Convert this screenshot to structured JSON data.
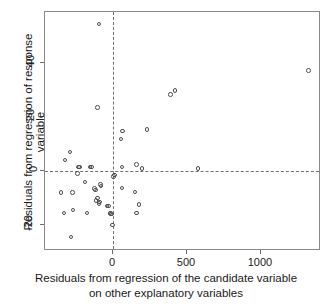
{
  "chart_data": {
    "type": "scatter",
    "title": "",
    "xlabel": "Residuals from regression of the candidate variable on other explanatory variables",
    "xlabel_line1": "Residuals from regression of the candidate variable",
    "xlabel_line2": "on other explanatory variables",
    "ylabel": "Residuals from regression of response variable",
    "xlim": [
      -430,
      1430
    ],
    "ylim": [
      -29,
      59
    ],
    "xticks": [
      0,
      500,
      1000
    ],
    "xticklabels": [
      "0",
      "500",
      "1000"
    ],
    "yticks": [
      -20,
      0,
      20,
      40
    ],
    "yticklabels": [
      "-20",
      "0",
      "20",
      "40"
    ],
    "grid": false,
    "reference_lines": [
      {
        "orientation": "horizontal",
        "value": 0,
        "style": "dashed"
      },
      {
        "orientation": "vertical",
        "value": 0,
        "style": "dashed"
      }
    ],
    "marker": "open-circle",
    "marker_color": "#4d4d4d",
    "points": [
      {
        "x": -95,
        "y": 54.5
      },
      {
        "x": -105,
        "y": 23.5
      },
      {
        "x": -290,
        "y": 7.0
      },
      {
        "x": -325,
        "y": 4.0
      },
      {
        "x": -235,
        "y": 1.5
      },
      {
        "x": -225,
        "y": 1.5
      },
      {
        "x": -155,
        "y": 1.5
      },
      {
        "x": -145,
        "y": 1.5
      },
      {
        "x": -240,
        "y": -1.0
      },
      {
        "x": -190,
        "y": -4.0
      },
      {
        "x": -350,
        "y": -8.0
      },
      {
        "x": -275,
        "y": -8.0
      },
      {
        "x": -120,
        "y": -7.0
      },
      {
        "x": -125,
        "y": -6.5
      },
      {
        "x": -80,
        "y": -5.5
      },
      {
        "x": -85,
        "y": -5.0
      },
      {
        "x": -115,
        "y": -11.0
      },
      {
        "x": -105,
        "y": -10.0
      },
      {
        "x": -95,
        "y": -12.0
      },
      {
        "x": -90,
        "y": -11.5
      },
      {
        "x": -40,
        "y": -13.0
      },
      {
        "x": -30,
        "y": -13.0
      },
      {
        "x": -330,
        "y": -15.5
      },
      {
        "x": -270,
        "y": -14.5
      },
      {
        "x": -175,
        "y": -15.5
      },
      {
        "x": -20,
        "y": -15.5
      },
      {
        "x": -15,
        "y": -15.8
      },
      {
        "x": -10,
        "y": -16.0
      },
      {
        "x": -5,
        "y": -20.0
      },
      {
        "x": -285,
        "y": -24.5
      },
      {
        "x": 10,
        "y": -1.5
      },
      {
        "x": 5,
        "y": -2.0
      },
      {
        "x": 60,
        "y": 1.5
      },
      {
        "x": 55,
        "y": 11.8
      },
      {
        "x": 65,
        "y": 14.8
      },
      {
        "x": 230,
        "y": 15.3
      },
      {
        "x": 160,
        "y": 2.3
      },
      {
        "x": 195,
        "y": 1.0
      },
      {
        "x": 390,
        "y": 28.3
      },
      {
        "x": 420,
        "y": 29.8
      },
      {
        "x": 575,
        "y": 1.0
      },
      {
        "x": 60,
        "y": -6.3
      },
      {
        "x": 150,
        "y": -7.8
      },
      {
        "x": 175,
        "y": -12.3
      },
      {
        "x": 160,
        "y": -15.5
      },
      {
        "x": 1320,
        "y": 37.3
      }
    ]
  }
}
